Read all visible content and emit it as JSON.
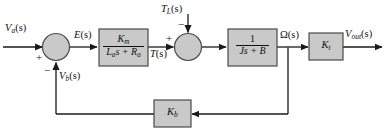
{
  "diagram": {
    "type": "control-system-block-diagram",
    "width": 386,
    "height": 134,
    "colors": {
      "block_fill": "#c9c9c9",
      "block_stroke": "#4a4a4a",
      "line": "#1a1a1a",
      "background": "#ffffff",
      "text": "#111111"
    }
  },
  "signals": {
    "input": "V",
    "input_sub": "a",
    "input_suffix": "(s)",
    "error": "E",
    "error_suffix": "(s)",
    "torque": "T",
    "torque_suffix": "(s)",
    "load_torque": "T",
    "load_torque_sub": "L",
    "load_torque_suffix": "(s)",
    "speed": "Ω",
    "speed_suffix": "(s)",
    "output": "V",
    "output_sub": "out",
    "output_suffix": "(s)",
    "back_emf": "V",
    "back_emf_sub": "b",
    "back_emf_suffix": "(s)"
  },
  "blocks": [
    {
      "id": "armature-transfer-function",
      "name": "armature-block",
      "numerator": "K",
      "numerator_sub": "m",
      "denominator": "L",
      "denominator_sub": "a",
      "denominator_rest": "s + R",
      "denominator_sub2": "a",
      "label_text": "Km / (La s + Ra)"
    },
    {
      "id": "mechanical-transfer-function",
      "name": "inertia-block",
      "numerator": "1",
      "denominator": "Js + B",
      "label_text": "1 / (Js + B)"
    },
    {
      "id": "tachometer-gain",
      "name": "kt-block",
      "gain": "K",
      "gain_sub": "t",
      "label_text": "Kt"
    },
    {
      "id": "back-emf-gain",
      "name": "kb-block",
      "gain": "K",
      "gain_sub": "b",
      "label_text": "Kb"
    }
  ],
  "summing_junctions": [
    {
      "id": "input-summing-junction",
      "signs": {
        "left": "+",
        "bottom": "−"
      }
    },
    {
      "id": "torque-summing-junction",
      "signs": {
        "left": "+",
        "top": "−"
      }
    }
  ]
}
